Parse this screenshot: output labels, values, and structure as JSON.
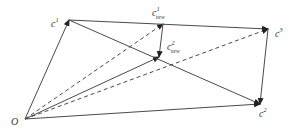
{
  "diagram": {
    "colors": {
      "stroke": "#4a4a4a",
      "text": "#333333",
      "background": "#ffffff"
    },
    "points": {
      "O": {
        "x": 25,
        "y": 119
      },
      "c1": {
        "x": 69,
        "y": 20
      },
      "c1new": {
        "x": 163,
        "y": 24
      },
      "c2new": {
        "x": 159,
        "y": 57
      },
      "c3": {
        "x": 268,
        "y": 29
      },
      "c2": {
        "x": 260,
        "y": 104
      }
    },
    "labels": {
      "origin": "O",
      "c1": {
        "base": "c",
        "sup": "1"
      },
      "c1new": {
        "base": "c",
        "sup": "1",
        "sub": "new"
      },
      "c2new": {
        "base": "c",
        "sup": "2",
        "sub": "new"
      },
      "c3": {
        "base": "c",
        "sup": "3"
      },
      "c2": {
        "base": "c",
        "sup": "2"
      }
    },
    "edges": [
      {
        "from": "O",
        "to": "c1",
        "style": "solid",
        "arrow": true
      },
      {
        "from": "O",
        "to": "c1new",
        "style": "dashed",
        "arrow": true
      },
      {
        "from": "O",
        "to": "c2new",
        "style": "solid",
        "arrow": true
      },
      {
        "from": "O",
        "to": "c3",
        "style": "dashed",
        "arrow": true
      },
      {
        "from": "O",
        "to": "c2",
        "style": "solid",
        "arrow": true
      },
      {
        "from": "c1",
        "to": "c3",
        "style": "solid",
        "arrow": true
      },
      {
        "from": "c1",
        "to": "c2",
        "style": "solid",
        "arrow": true
      },
      {
        "from": "c3",
        "to": "c2",
        "style": "solid",
        "arrow": true
      },
      {
        "from": "c1new",
        "to": "c2new",
        "style": "solid",
        "arrow": true
      }
    ]
  }
}
